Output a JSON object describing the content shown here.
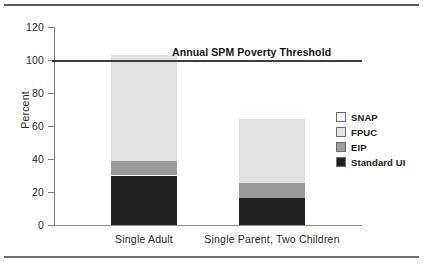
{
  "chart_data": {
    "type": "bar",
    "title": "",
    "subtitle": "",
    "xlabel": "",
    "ylabel": "Percent",
    "ylim": [
      0,
      120
    ],
    "yticks": [
      0,
      20,
      40,
      60,
      80,
      100,
      120
    ],
    "ytick_labels": [
      "0",
      "20",
      "40",
      "60",
      "80",
      "100",
      "120"
    ],
    "grid": false,
    "stacked": true,
    "legend_position": "right",
    "categories": [
      "Single Adult",
      "Single Parent, Two Children"
    ],
    "series": [
      {
        "name": "Standard UI",
        "color": "#232323",
        "values": [
          30.0,
          16.5
        ]
      },
      {
        "name": "EIP",
        "color": "#9a9a9a",
        "values": [
          8.5,
          9.0
        ]
      },
      {
        "name": "FPUC",
        "color": "#e2e2e2",
        "values": [
          64.5,
          38.5
        ]
      },
      {
        "name": "SNAP",
        "color": "#fdfdfd",
        "values": [
          4.5,
          9.0
        ]
      }
    ],
    "totals": [
      107.5,
      73.0
    ],
    "annotations": [
      {
        "name": "annual-spm-poverty-threshold",
        "text": "Annual SPM Poverty Threshold",
        "type": "hline",
        "value": 100,
        "color": "#3a3f43"
      }
    ]
  },
  "axis": {
    "y_title": "Percent",
    "y_tick_labels": [
      "120",
      "100",
      "80",
      "60",
      "40",
      "20",
      "0"
    ],
    "x_tick_labels": [
      "Single Adult",
      "Single Parent, Two Children"
    ]
  },
  "threshold": {
    "label": "Annual SPM Poverty Threshold",
    "value": 100
  },
  "legend": {
    "items": [
      {
        "label": "SNAP",
        "swatch": "legend-swatch-snap",
        "color": "#fdfdfd"
      },
      {
        "label": "FPUC",
        "swatch": "legend-swatch-fpuc",
        "color": "#e2e2e2"
      },
      {
        "label": "EIP",
        "swatch": "legend-swatch-eip",
        "color": "#9a9a9a"
      },
      {
        "label": "Standard UI",
        "swatch": "legend-swatch-standard-ui",
        "color": "#232323"
      }
    ]
  }
}
